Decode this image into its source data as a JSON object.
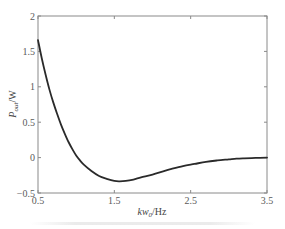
{
  "chart_data": {
    "type": "line",
    "title": "",
    "xlabel": "kw0/Hz",
    "xlabel_parts": {
      "main": "kw",
      "sub": "0",
      "unit": "/Hz"
    },
    "ylabel": "Pout/W",
    "ylabel_parts": {
      "main": "P",
      "sub": "out",
      "unit": "/W"
    },
    "xlim": [
      0.5,
      3.5
    ],
    "ylim": [
      -0.5,
      2
    ],
    "xticks": [
      0.5,
      1.5,
      2.5,
      3.5
    ],
    "xtick_labels": [
      "0.5",
      "1.5",
      "2.5",
      "3.5"
    ],
    "yticks": [
      -0.5,
      0,
      0.5,
      1,
      1.5,
      2
    ],
    "ytick_labels": [
      "-0.5",
      "0",
      "0.5",
      "1",
      "1.5",
      "2"
    ],
    "grid": false,
    "legend": null,
    "series": [
      {
        "name": "Pout",
        "color": "#2a2a2a",
        "x": [
          0.5,
          0.55,
          0.6,
          0.65,
          0.7,
          0.75,
          0.8,
          0.85,
          0.9,
          0.95,
          1.0,
          1.05,
          1.1,
          1.2,
          1.3,
          1.4,
          1.5,
          1.57,
          1.65,
          1.75,
          1.85,
          2.0,
          2.15,
          2.25,
          2.4,
          2.55,
          2.7,
          2.85,
          3.0,
          3.1,
          3.2,
          3.35,
          3.5
        ],
        "y": [
          1.66,
          1.4,
          1.17,
          0.96,
          0.78,
          0.62,
          0.47,
          0.34,
          0.22,
          0.12,
          0.03,
          -0.04,
          -0.1,
          -0.19,
          -0.26,
          -0.3,
          -0.33,
          -0.335,
          -0.33,
          -0.31,
          -0.28,
          -0.24,
          -0.19,
          -0.16,
          -0.12,
          -0.09,
          -0.06,
          -0.04,
          -0.025,
          -0.015,
          -0.01,
          -0.005,
          0.0
        ]
      }
    ]
  },
  "plot_area": {
    "left": 38,
    "top": 16,
    "right": 267,
    "bottom": 193
  }
}
